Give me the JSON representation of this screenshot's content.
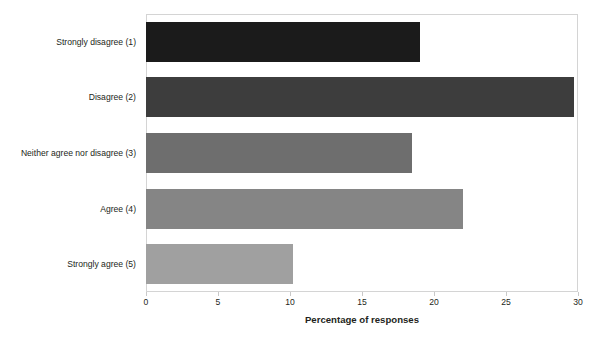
{
  "chart_data": {
    "type": "bar",
    "orientation": "horizontal",
    "title": "",
    "subtitle": "",
    "xlabel": "Percentage of responses",
    "ylabel": "",
    "categories": [
      "Strongly disagree (1)",
      "Disagree (2)",
      "Neither agree nor disagree (3)",
      "Agree (4)",
      "Strongly agree (5)"
    ],
    "values": [
      19.0,
      29.7,
      18.5,
      22.0,
      10.2
    ],
    "bar_colors": [
      "#1b1b1b",
      "#3d3d3d",
      "#6e6e6e",
      "#858585",
      "#a0a0a0"
    ],
    "xlim": [
      0,
      30
    ],
    "xticks": [
      0,
      5,
      10,
      15,
      20,
      25,
      30
    ],
    "xtick_labels": [
      "0",
      "5",
      "10",
      "15",
      "20",
      "25",
      "30"
    ],
    "grid": false,
    "legend": false,
    "legend_position": "none",
    "plot_border_color": "#d4d4d4",
    "background_color": "#ffffff",
    "text_color": "#231f20"
  }
}
